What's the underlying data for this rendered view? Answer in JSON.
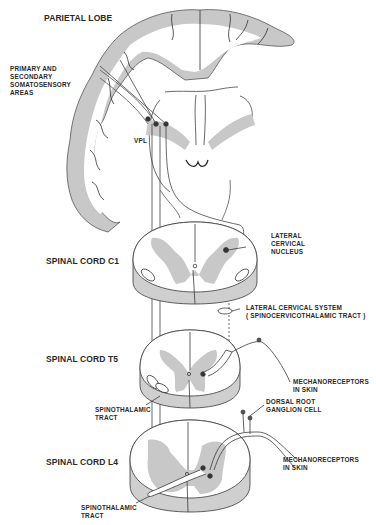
{
  "diagram": {
    "title": "Parietal Lobe",
    "colors": {
      "gray_matter": "#c8c8c8",
      "line": "#3a3a3a",
      "background": "#ffffff",
      "text": "#2a2a2a"
    },
    "section_labels": {
      "parietal_lobe": "PARIETAL LOBE",
      "spinal_cord_c1": "SPINAL CORD C1",
      "spinal_cord_t5": "SPINAL CORD T5",
      "spinal_cord_l4": "SPINAL CORD L4"
    },
    "annotations": {
      "somatosensory_1": "PRIMARY AND",
      "somatosensory_2": "SECONDARY",
      "somatosensory_3": "SOMATOSENSORY",
      "somatosensory_4": "AREAS",
      "vpl": "VPL",
      "lateral_cervical_nucleus_1": "LATERAL",
      "lateral_cervical_nucleus_2": "CERVICAL",
      "lateral_cervical_nucleus_3": "NUCLEUS",
      "lateral_cervical_system_1": "LATERAL CERVICAL SYSTEM",
      "lateral_cervical_system_2": "( SPINOCERVICOTHALAMIC TRACT )",
      "mechanoreceptors_t5_1": "MECHANORECEPTORS",
      "mechanoreceptors_t5_2": "IN SKIN",
      "spinothalamic_t5_1": "SPINOTHALAMIC",
      "spinothalamic_t5_2": "TRACT",
      "dorsal_root_1": "DORSAL ROOT",
      "dorsal_root_2": "GANGLION CELL",
      "mechanoreceptors_l4_1": "MECHANORECEPTORS",
      "mechanoreceptors_l4_2": "IN SKIN",
      "spinothalamic_l4_1": "SPINOTHALAMIC",
      "spinothalamic_l4_2": "TRACT"
    }
  }
}
